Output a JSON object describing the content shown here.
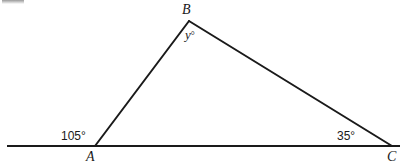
{
  "figure": {
    "kind": "geometry-diagram",
    "background_color": "#ffffff",
    "stroke_color": "#1a1a1a",
    "stroke_width": 2,
    "vertices": {
      "A": {
        "label": "A",
        "x": 95,
        "y": 146
      },
      "B": {
        "label": "B",
        "x": 189,
        "y": 21
      },
      "C": {
        "label": "C",
        "x": 392,
        "y": 146
      }
    },
    "baseline": {
      "name": "horizontal-ray",
      "x1": 7,
      "y1": 146,
      "x2": 400,
      "y2": 146
    },
    "segments": [
      {
        "name": "segment-AB",
        "x1": 95,
        "y1": 146,
        "x2": 189,
        "y2": 21
      },
      {
        "name": "segment-BC",
        "x1": 189,
        "y1": 21,
        "x2": 392,
        "y2": 146
      }
    ],
    "angles": {
      "exterior_at_A": {
        "value": "105°",
        "measure": 105,
        "at": "A"
      },
      "interior_at_C": {
        "value": "35°",
        "measure": 35,
        "at": "C"
      },
      "unknown_at_B": {
        "variable": "y",
        "degree_symbol": "°",
        "at": "B"
      }
    }
  }
}
